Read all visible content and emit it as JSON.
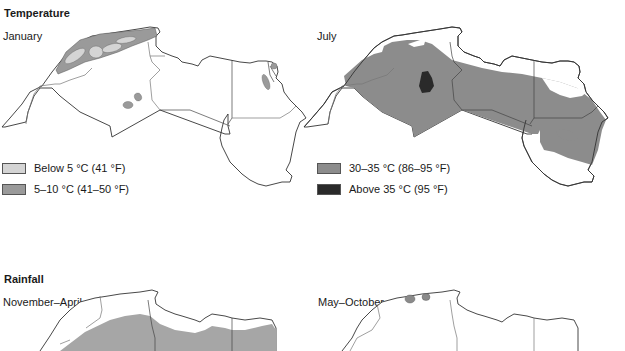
{
  "temperature": {
    "title": "Temperature",
    "january": {
      "title": "January",
      "legend": [
        {
          "label": "Below 5 °C (41 °F)",
          "color": "#d4d4d4"
        },
        {
          "label": "5–10 °C (41–50 °F)",
          "color": "#9a9a9a"
        }
      ]
    },
    "july": {
      "title": "July",
      "legend": [
        {
          "label": "30–35 °C (86–95 °F)",
          "color": "#8c8c8c"
        },
        {
          "label": "Above 35 °C (95 °F)",
          "color": "#2a2a2a"
        }
      ]
    }
  },
  "rainfall": {
    "title": "Rainfall",
    "nov_apr": {
      "title": "November–April",
      "color": "#a6a6a6"
    },
    "may_oct": {
      "title": "May–October",
      "color": "#8a8a8a"
    }
  },
  "colors": {
    "border": "#333333",
    "inner_border": "#777777",
    "land": "#ffffff"
  }
}
